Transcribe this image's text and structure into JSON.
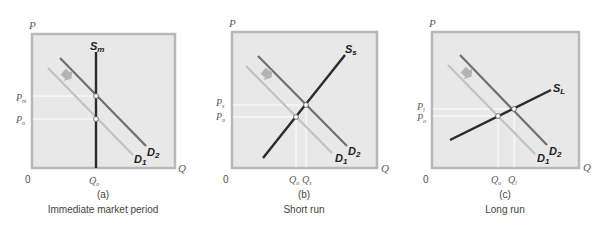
{
  "colors": {
    "plot_bg": "#e8e8e8",
    "plot_border": "#b8b8b8",
    "guide_line": "#ffffff",
    "supply": "#2b2b2b",
    "demand_new": "#6f6f6f",
    "demand_old": "#c2c2c2",
    "shift_arrow": "#b4b4b4"
  },
  "panels": [
    {
      "id": "a",
      "axis_y": "P",
      "axis_x": "Q",
      "origin": "0",
      "supply_label": "S",
      "supply_sub": "m",
      "demand_new_label": "D",
      "demand_new_sub": "2",
      "demand_old_label": "D",
      "demand_old_sub": "1",
      "price_labels": [
        {
          "main": "P",
          "sub": "m"
        },
        {
          "main": "P",
          "sub": "o"
        }
      ],
      "quantity_labels": [
        {
          "main": "Q",
          "sub": "o"
        }
      ],
      "panel_letter": "(a)",
      "caption": "Immediate market period"
    },
    {
      "id": "b",
      "axis_y": "P",
      "axis_x": "Q",
      "origin": "0",
      "supply_label": "S",
      "supply_sub": "s",
      "demand_new_label": "D",
      "demand_new_sub": "2",
      "demand_old_label": "D",
      "demand_old_sub": "1",
      "price_labels": [
        {
          "main": "P",
          "sub": "s"
        },
        {
          "main": "P",
          "sub": "o"
        }
      ],
      "quantity_labels": [
        {
          "main": "Q",
          "sub": "o"
        },
        {
          "main": "Q",
          "sub": "s"
        }
      ],
      "panel_letter": "(b)",
      "caption": "Short run"
    },
    {
      "id": "c",
      "axis_y": "P",
      "axis_x": "Q",
      "origin": "0",
      "supply_label": "S",
      "supply_sub": "L",
      "demand_new_label": "D",
      "demand_new_sub": "2",
      "demand_old_label": "D",
      "demand_old_sub": "1",
      "price_labels": [
        {
          "main": "P",
          "sub": "l"
        },
        {
          "main": "P",
          "sub": "o"
        }
      ],
      "quantity_labels": [
        {
          "main": "Q",
          "sub": "o"
        },
        {
          "main": "Q",
          "sub": "l"
        }
      ],
      "panel_letter": "(c)",
      "caption": "Long run"
    }
  ]
}
